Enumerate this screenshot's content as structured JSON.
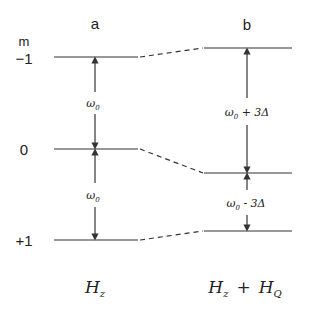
{
  "diagram": {
    "type": "energy-level-diagram",
    "columns": [
      {
        "id": "a",
        "label": "a",
        "hamiltonian": {
          "symbol": "H",
          "subscript": "z"
        }
      },
      {
        "id": "b",
        "label": "b",
        "hamiltonian": {
          "symbol": "H",
          "subscript": "z",
          "plus": "+",
          "symbol2": "H",
          "subscript2": "Q"
        }
      }
    ],
    "axis_label": "m",
    "levels": [
      {
        "m": "−1",
        "left_y": 57,
        "right_y": 48
      },
      {
        "m": "0",
        "left_y": 149,
        "right_y": 173
      },
      {
        "m": "+1",
        "left_y": 240,
        "right_y": 231
      }
    ],
    "transitions": {
      "a": [
        {
          "from": "−1",
          "to": "0",
          "label": "ω",
          "sub": "0"
        },
        {
          "from": "0",
          "to": "+1",
          "label": "ω",
          "sub": "0"
        }
      ],
      "b": [
        {
          "from": "−1",
          "to": "0",
          "label": "ω",
          "sub": "0",
          "suffix": " + 3Δ"
        },
        {
          "from": "0",
          "to": "+1",
          "label": "ω",
          "sub": "0",
          "suffix": " - 3Δ"
        }
      ]
    },
    "line_color": "#333333"
  }
}
